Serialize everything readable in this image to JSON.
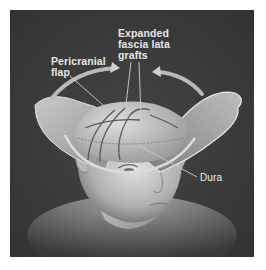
{
  "figure": {
    "colors": {
      "background": "#3a3a3a",
      "page": "#ffffff",
      "label_text": "#e6e6e6",
      "leader_line": "#cfcfcf"
    },
    "labels": [
      {
        "id": "expanded",
        "text_lines": [
          "Expanded",
          "fascia lata",
          "grafts"
        ]
      },
      {
        "id": "pericranial",
        "text_lines": [
          "Pericranial",
          "flap"
        ]
      },
      {
        "id": "dura",
        "text_lines": [
          "Dura"
        ]
      }
    ]
  }
}
